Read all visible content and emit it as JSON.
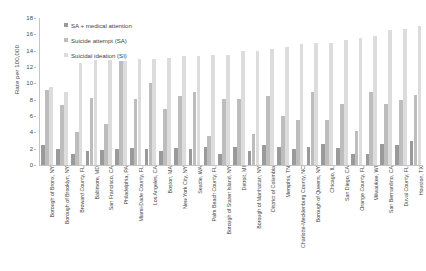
{
  "chart_data": {
    "type": "bar",
    "title": "",
    "xlabel": "",
    "ylabel": "Rate per 100,000",
    "ylim": [
      0,
      18
    ],
    "yticks": [
      0,
      2,
      4,
      6,
      8,
      10,
      12,
      14,
      16,
      18
    ],
    "grid": false,
    "legend_position": "top-left",
    "orientation": "vertical",
    "grouping": "grouped",
    "categories": [
      "Borough of Bronx, NY",
      "Borough of Brooklyn, NY",
      "Broward County, FL",
      "Baltimore, MD",
      "San Francisco, CA",
      "Philadelphia, PA",
      "Miami-Dade County, FL",
      "Los Angeles, CA",
      "Boston, MA",
      "New York City, NY",
      "Seattle, WA",
      "Palm Beach County, FL",
      "Borough of Staten Island, NY",
      "Detroit, MI",
      "Borough of Manhattan, NY",
      "District of Columbia",
      "Memphis, TN",
      "Charlotte-Mecklenburg County, NC",
      "Borough of Queens, NY",
      "Chicago, IL",
      "San Diego, CA",
      "Orange County, FL",
      "Milwaukee, WI",
      "San Bernardino, CA",
      "Duval County, FL",
      "Houston, TX"
    ],
    "series": [
      {
        "name": "SA + medical attention",
        "color": "#9a9a9a",
        "values": [
          2.4,
          2.0,
          1.4,
          1.7,
          1.8,
          2.0,
          2.1,
          1.9,
          1.7,
          2.1,
          2.0,
          2.2,
          1.3,
          2.2,
          1.7,
          2.4,
          2.2,
          2.0,
          2.2,
          2.6,
          2.1,
          1.4,
          1.4,
          2.6,
          2.4,
          2.9
        ]
      },
      {
        "name": "Suicide attempt (SA)",
        "color": "#bdbdbd",
        "values": [
          9.2,
          7.4,
          4.1,
          8.2,
          5.0,
          12.7,
          8.1,
          10.1,
          6.9,
          8.4,
          9.0,
          3.6,
          8.1,
          8.1,
          3.8,
          8.4,
          6.0,
          5.5,
          9.0,
          5.5,
          7.5,
          4.2,
          9.0,
          7.5,
          8.0,
          8.6
        ]
      },
      {
        "name": "Suicidal ideation (SI)",
        "color": "#dcdcdc",
        "values": [
          9.5,
          9.0,
          12.5,
          12.8,
          12.8,
          12.7,
          13.0,
          13.0,
          13.1,
          13.4,
          13.4,
          13.5,
          13.5,
          14.0,
          14.0,
          14.2,
          14.5,
          14.8,
          15.0,
          15.0,
          15.3,
          15.5,
          15.8,
          16.5,
          16.6,
          17.0
        ]
      }
    ]
  }
}
